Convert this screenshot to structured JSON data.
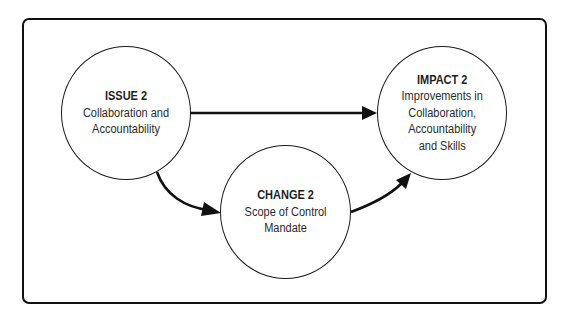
{
  "diagram": {
    "type": "flow",
    "nodes": [
      {
        "id": "issue",
        "title": "ISSUE 2",
        "lines": [
          "Collaboration and",
          "Accountability"
        ]
      },
      {
        "id": "change",
        "title": "CHANGE 2",
        "lines": [
          "Scope of Control",
          "Mandate"
        ]
      },
      {
        "id": "impact",
        "title": "IMPACT 2",
        "lines": [
          "Improvements in",
          "Collaboration,",
          "Accountability",
          "and Skills"
        ]
      }
    ],
    "edges": [
      {
        "from": "issue",
        "to": "impact",
        "style": "straight"
      },
      {
        "from": "issue",
        "to": "change",
        "style": "curved"
      },
      {
        "from": "change",
        "to": "impact",
        "style": "curved"
      }
    ],
    "colors": {
      "stroke": "#111111",
      "node_fill": "#ffffff",
      "node_rim": "#9a9a9a",
      "text": "#2a2a2a"
    }
  }
}
